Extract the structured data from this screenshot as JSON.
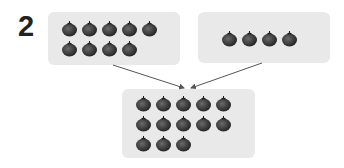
{
  "problem_number": "2",
  "colors": {
    "box": "#e9e9e9",
    "fruit": "#3a3a3a",
    "arrow": "#555555"
  },
  "groups": [
    {
      "name": "group-left",
      "count": 9,
      "rect": [
        48,
        12,
        132,
        53
      ],
      "fruits": [
        [
          69,
          28
        ],
        [
          89,
          28
        ],
        [
          109,
          28
        ],
        [
          129,
          28
        ],
        [
          149,
          28
        ],
        [
          69,
          48
        ],
        [
          89,
          48
        ],
        [
          109,
          48
        ],
        [
          129,
          48
        ]
      ]
    },
    {
      "name": "group-right",
      "count": 4,
      "rect": [
        198,
        12,
        132,
        51
      ],
      "fruits": [
        [
          229,
          38
        ],
        [
          249,
          38
        ],
        [
          269,
          38
        ],
        [
          289,
          38
        ]
      ]
    },
    {
      "name": "group-total",
      "count": 13,
      "rect": [
        122,
        89,
        133,
        69
      ],
      "fruits": [
        [
          143,
          103
        ],
        [
          163,
          103
        ],
        [
          183,
          103
        ],
        [
          203,
          103
        ],
        [
          223,
          103
        ],
        [
          143,
          123
        ],
        [
          163,
          123
        ],
        [
          183,
          123
        ],
        [
          203,
          123
        ],
        [
          223,
          123
        ],
        [
          143,
          143
        ],
        [
          163,
          143
        ],
        [
          183,
          143
        ]
      ]
    }
  ],
  "arrows": [
    {
      "from": [
        113,
        65
      ],
      "to": [
        184,
        88
      ]
    },
    {
      "from": [
        262,
        63
      ],
      "to": [
        191,
        88
      ]
    }
  ],
  "fruit_icon": "tomato-icon"
}
